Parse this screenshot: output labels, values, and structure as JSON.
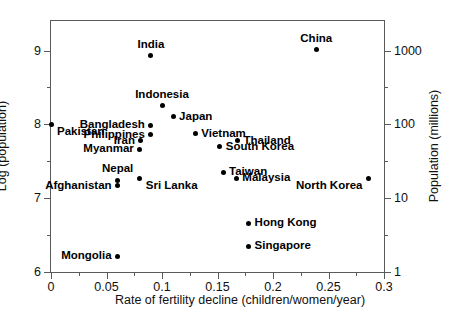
{
  "chart_data": {
    "type": "scatter",
    "title": "",
    "xlabel": "Rate of fertility decline (children/women/year)",
    "ylabel": "Log (population)",
    "ylabel_right": "Population (millions)",
    "xlim": [
      0,
      0.3
    ],
    "ylim": [
      6,
      9.4
    ],
    "grid": false,
    "legend": "none",
    "xticks": [
      {
        "value": 0,
        "label": "0",
        "major": true
      },
      {
        "value": 0.025,
        "label": "",
        "major": false
      },
      {
        "value": 0.05,
        "label": "0.05",
        "major": true
      },
      {
        "value": 0.075,
        "label": "",
        "major": false
      },
      {
        "value": 0.1,
        "label": "0.1",
        "major": true
      },
      {
        "value": 0.125,
        "label": "",
        "major": false
      },
      {
        "value": 0.15,
        "label": "0.15",
        "major": true
      },
      {
        "value": 0.175,
        "label": "",
        "major": false
      },
      {
        "value": 0.2,
        "label": "0.2",
        "major": true
      },
      {
        "value": 0.225,
        "label": "",
        "major": false
      },
      {
        "value": 0.25,
        "label": "0.25",
        "major": true
      },
      {
        "value": 0.275,
        "label": "",
        "major": false
      },
      {
        "value": 0.3,
        "label": "0.3",
        "major": true
      }
    ],
    "yticks_left": [
      {
        "value": 9,
        "label": "9",
        "major": true
      },
      {
        "value": 8.5,
        "label": "",
        "major": false
      },
      {
        "value": 8,
        "label": "8",
        "major": true
      },
      {
        "value": 7.5,
        "label": "",
        "major": false
      },
      {
        "value": 7,
        "label": "7",
        "major": true
      },
      {
        "value": 6.5,
        "label": "",
        "major": false
      },
      {
        "value": 6,
        "label": "6",
        "major": true
      }
    ],
    "yticks_right": [
      {
        "value": 9,
        "label": "1000",
        "major": true
      },
      {
        "value": 8.5,
        "label": "",
        "major": false
      },
      {
        "value": 8,
        "label": "100",
        "major": true
      },
      {
        "value": 7.5,
        "label": "",
        "major": false
      },
      {
        "value": 7,
        "label": "10",
        "major": true
      },
      {
        "value": 6.5,
        "label": "",
        "major": false
      },
      {
        "value": 6,
        "label": "1",
        "major": true
      }
    ],
    "points": [
      {
        "name": "China",
        "x": 0.239,
        "y": 9.01,
        "label_pos": "above"
      },
      {
        "name": "India",
        "x": 0.09,
        "y": 8.93,
        "label_pos": "above"
      },
      {
        "name": "Indonesia",
        "x": 0.1,
        "y": 8.25,
        "label_pos": "above"
      },
      {
        "name": "Japan",
        "x": 0.11,
        "y": 8.1,
        "label_pos": "right"
      },
      {
        "name": "Bangladesh",
        "x": 0.09,
        "y": 7.99,
        "label_pos": "left"
      },
      {
        "name": "Pakistan",
        "x": 0.0,
        "y": 8.0,
        "label_pos": "below-right"
      },
      {
        "name": "Philippines",
        "x": 0.09,
        "y": 7.86,
        "label_pos": "left"
      },
      {
        "name": "Vietnam",
        "x": 0.13,
        "y": 7.87,
        "label_pos": "right"
      },
      {
        "name": "Thailand",
        "x": 0.168,
        "y": 7.78,
        "label_pos": "right"
      },
      {
        "name": "Iran",
        "x": 0.081,
        "y": 7.78,
        "label_pos": "left"
      },
      {
        "name": "South Korea",
        "x": 0.152,
        "y": 7.7,
        "label_pos": "right"
      },
      {
        "name": "Myanmar",
        "x": 0.08,
        "y": 7.66,
        "label_pos": "left"
      },
      {
        "name": "Taiwan",
        "x": 0.155,
        "y": 7.35,
        "label_pos": "right"
      },
      {
        "name": "Malaysia",
        "x": 0.167,
        "y": 7.27,
        "label_pos": "right"
      },
      {
        "name": "Sri Lanka",
        "x": 0.08,
        "y": 7.27,
        "label_pos": "below-right"
      },
      {
        "name": "Nepal",
        "x": 0.06,
        "y": 7.24,
        "label_pos": "above"
      },
      {
        "name": "Afghanistan",
        "x": 0.06,
        "y": 7.17,
        "label_pos": "left"
      },
      {
        "name": "North Korea",
        "x": 0.286,
        "y": 7.27,
        "label_pos": "below-left"
      },
      {
        "name": "Hong Kong",
        "x": 0.178,
        "y": 6.66,
        "label_pos": "right"
      },
      {
        "name": "Singapore",
        "x": 0.178,
        "y": 6.35,
        "label_pos": "right"
      },
      {
        "name": "Mongolia",
        "x": 0.06,
        "y": 6.21,
        "label_pos": "left"
      }
    ]
  }
}
